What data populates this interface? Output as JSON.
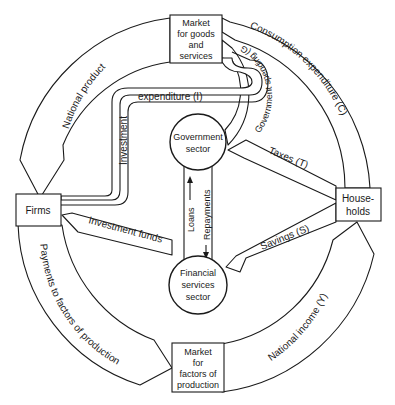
{
  "diagram": {
    "type": "circular-flow-of-income",
    "nodes": {
      "market_goods": [
        "Market",
        "for goods",
        "and",
        "services"
      ],
      "firms": "Firms",
      "households": [
        "House-",
        "holds"
      ],
      "market_factors": [
        "Market",
        "for",
        "factors of",
        "production"
      ],
      "government": [
        "Government",
        "sector"
      ],
      "financial": [
        "Financial",
        "services",
        "sector"
      ]
    },
    "flows": {
      "national_product": "National product",
      "consumption": "Consumption expenditure (C)",
      "government_spending": "Government spending (G)",
      "investment_vertical": "Investment",
      "investment_horizontal": "expenditure (I)",
      "taxes": "Taxes (T)",
      "savings": "Savings (S)",
      "investment_funds": "Investment funds",
      "loans": "Loans",
      "repayments": "Repayments",
      "payments_factors": "Payments to factors of production",
      "national_income": "National income (Y)"
    }
  }
}
